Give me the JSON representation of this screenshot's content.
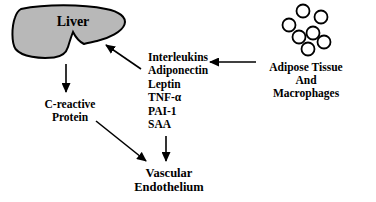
{
  "liver": {
    "label": "Liver"
  },
  "crp": {
    "line1": "C-reactive",
    "line2": "Protein"
  },
  "mediators": {
    "items": [
      "Interleukins",
      "Adiponectin",
      "Leptin",
      "TNF-α",
      "PAI-1",
      "SAA"
    ]
  },
  "adipose": {
    "line1": "Adipose Tissue",
    "line2": "And",
    "line3": "Macrophages"
  },
  "vascular": {
    "line1": "Vascular",
    "line2": "Endothelium"
  },
  "colors": {
    "liver_fill": "#b8b8b8",
    "adipocyte_fill": "#ffffff",
    "outline": "#000000",
    "text": "#000000",
    "background": "#ffffff"
  }
}
